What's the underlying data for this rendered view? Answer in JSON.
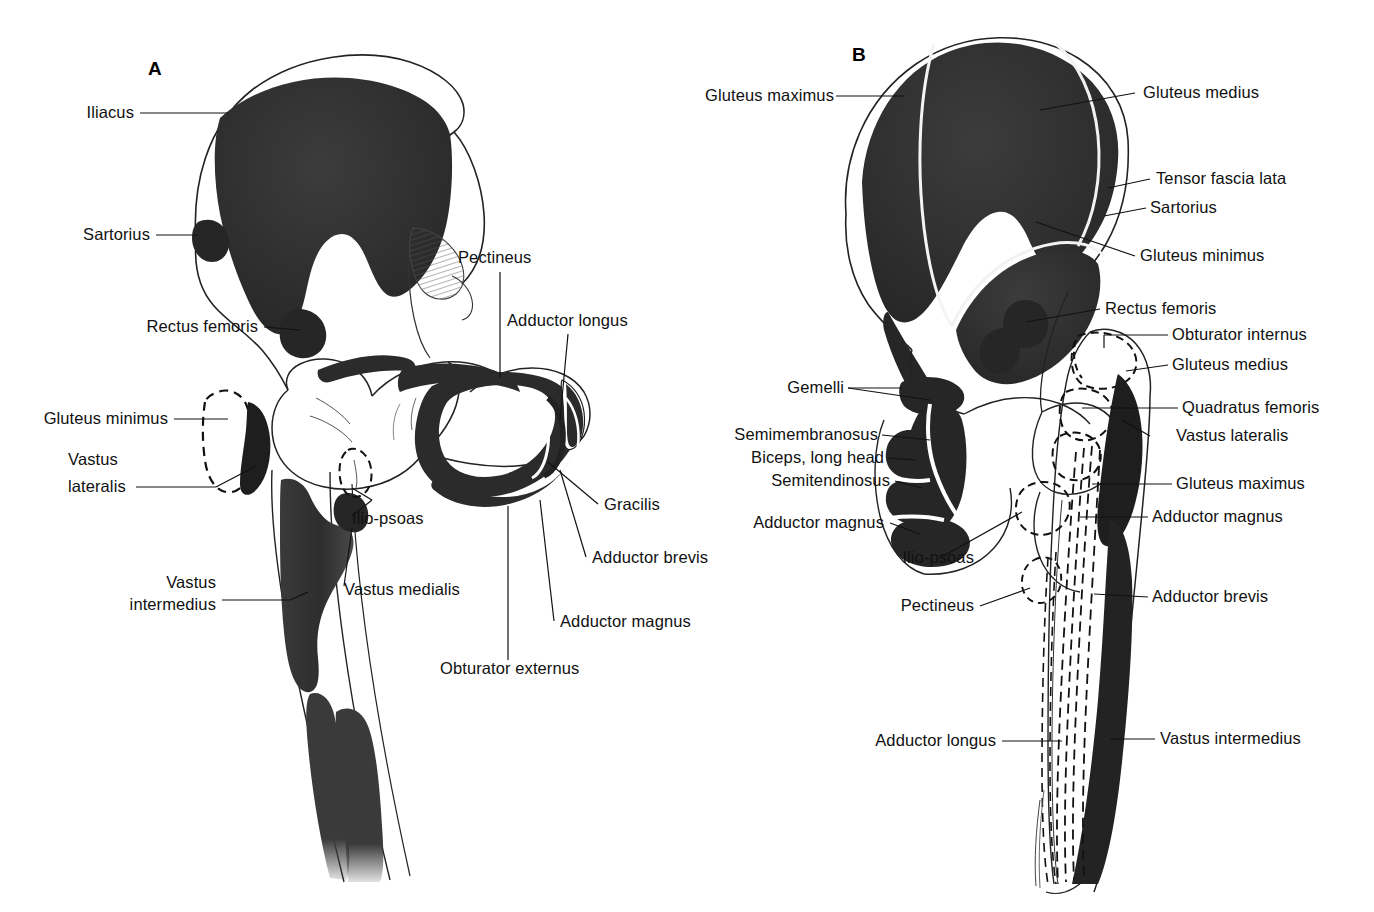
{
  "figure": {
    "type": "anatomical-diagram",
    "background_color": "#ffffff",
    "ink_color": "#111111",
    "fill_color": "#2b2b2b"
  },
  "panels": [
    {
      "id": "A",
      "letter": "A",
      "view": "anterior",
      "labels": [
        {
          "id": "a-iliacus",
          "text": "Iliacus",
          "side": "left"
        },
        {
          "id": "a-sartorius",
          "text": "Sartorius",
          "side": "left"
        },
        {
          "id": "a-rectus-femoris",
          "text": "Rectus femoris",
          "side": "left"
        },
        {
          "id": "a-gluteus-minimus",
          "text": "Gluteus minimus",
          "side": "left"
        },
        {
          "id": "a-vastus-lateralis-1",
          "text": "Vastus",
          "side": "left"
        },
        {
          "id": "a-vastus-lateralis-2",
          "text": "lateralis",
          "side": "left"
        },
        {
          "id": "a-vastus-intermedius-1",
          "text": "Vastus",
          "side": "left"
        },
        {
          "id": "a-vastus-intermedius-2",
          "text": "intermedius",
          "side": "left"
        },
        {
          "id": "a-ilio-psoas",
          "text": "Ilio-psoas",
          "side": "inner"
        },
        {
          "id": "a-vastus-medialis",
          "text": "Vastus medialis",
          "side": "inner"
        },
        {
          "id": "a-pectineus",
          "text": "Pectineus",
          "side": "right"
        },
        {
          "id": "a-adductor-longus",
          "text": "Adductor longus",
          "side": "right"
        },
        {
          "id": "a-gracilis",
          "text": "Gracilis",
          "side": "right"
        },
        {
          "id": "a-adductor-brevis",
          "text": "Adductor brevis",
          "side": "right"
        },
        {
          "id": "a-adductor-magnus",
          "text": "Adductor magnus",
          "side": "right"
        },
        {
          "id": "a-obturator-externus",
          "text": "Obturator externus",
          "side": "right"
        }
      ]
    },
    {
      "id": "B",
      "letter": "B",
      "view": "posterior",
      "labels": [
        {
          "id": "b-gluteus-maximus-l",
          "text": "Gluteus maximus",
          "side": "left"
        },
        {
          "id": "b-gemelli",
          "text": "Gemelli",
          "side": "left"
        },
        {
          "id": "b-semimembranosus",
          "text": "Semimembranosus",
          "side": "left"
        },
        {
          "id": "b-biceps-long-head",
          "text": "Biceps, long head",
          "side": "left"
        },
        {
          "id": "b-semitendinosus",
          "text": "Semitendinosus",
          "side": "left"
        },
        {
          "id": "b-adductor-magnus-l",
          "text": "Adductor magnus",
          "side": "left"
        },
        {
          "id": "b-ilio-psoas",
          "text": "Ilio-psoas",
          "side": "left"
        },
        {
          "id": "b-pectineus",
          "text": "Pectineus",
          "side": "left"
        },
        {
          "id": "b-adductor-longus",
          "text": "Adductor longus",
          "side": "left"
        },
        {
          "id": "b-gluteus-medius-top",
          "text": "Gluteus medius",
          "side": "right"
        },
        {
          "id": "b-tensor-fascia-lata",
          "text": "Tensor fascia lata",
          "side": "right"
        },
        {
          "id": "b-sartorius",
          "text": "Sartorius",
          "side": "right"
        },
        {
          "id": "b-gluteus-minimus",
          "text": "Gluteus minimus",
          "side": "right"
        },
        {
          "id": "b-rectus-femoris",
          "text": "Rectus femoris",
          "side": "right"
        },
        {
          "id": "b-obturator-internus",
          "text": "Obturator internus",
          "side": "right"
        },
        {
          "id": "b-gluteus-medius-2",
          "text": "Gluteus medius",
          "side": "right"
        },
        {
          "id": "b-quadratus-femoris",
          "text": "Quadratus femoris",
          "side": "right"
        },
        {
          "id": "b-vastus-lateralis",
          "text": "Vastus lateralis",
          "side": "right"
        },
        {
          "id": "b-gluteus-maximus-r",
          "text": "Gluteus maximus",
          "side": "right"
        },
        {
          "id": "b-adductor-magnus-r",
          "text": "Adductor magnus",
          "side": "right"
        },
        {
          "id": "b-adductor-brevis",
          "text": "Adductor brevis",
          "side": "right"
        },
        {
          "id": "b-vastus-intermedius",
          "text": "Vastus intermedius",
          "side": "right"
        }
      ]
    }
  ]
}
